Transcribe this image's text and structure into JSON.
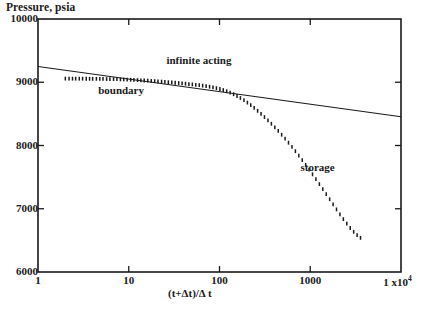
{
  "chart_data": {
    "type": "scatter",
    "title": "",
    "ylabel": "Pressure, psia",
    "xlabel": "(t+Δt)/Δ t",
    "xscale": "log",
    "yscale": "linear",
    "xlim": [
      1,
      10000
    ],
    "ylim": [
      6000,
      10000
    ],
    "grid": false,
    "legend": null,
    "xticks": [
      {
        "value": 1,
        "label": "1"
      },
      {
        "value": 10,
        "label": "10"
      },
      {
        "value": 100,
        "label": "100"
      },
      {
        "value": 1000,
        "label": "1000"
      },
      {
        "value": 10000,
        "label": "1 x10",
        "exponent": "4"
      }
    ],
    "yticks": [
      {
        "value": 6000,
        "label": "6000"
      },
      {
        "value": 7000,
        "label": "7000"
      },
      {
        "value": 8000,
        "label": "8000"
      },
      {
        "value": 9000,
        "label": "9000"
      },
      {
        "value": 10000,
        "label": "10000"
      }
    ],
    "annotations": [
      {
        "text": "boundary",
        "x": 4.6,
        "y": 8860
      },
      {
        "text": "infinite acting",
        "x": 26,
        "y": 9330
      },
      {
        "text": "storage",
        "x": 780,
        "y": 7640
      }
    ],
    "series": [
      {
        "name": "semilog straight line",
        "type": "line",
        "style": "solid",
        "color": "#1a1a1a",
        "points": [
          {
            "x": 1,
            "y": 9250
          },
          {
            "x": 10000,
            "y": 8455
          }
        ]
      },
      {
        "name": "pressure data",
        "type": "scatter",
        "marker": "tick",
        "color": "#1a1a1a",
        "points": [
          {
            "x": 2.0,
            "y": 9058
          },
          {
            "x": 2.2,
            "y": 9058
          },
          {
            "x": 2.4,
            "y": 9057
          },
          {
            "x": 2.6,
            "y": 9057
          },
          {
            "x": 2.85,
            "y": 9056
          },
          {
            "x": 3.1,
            "y": 9056
          },
          {
            "x": 3.4,
            "y": 9055
          },
          {
            "x": 3.7,
            "y": 9055
          },
          {
            "x": 4.0,
            "y": 9054
          },
          {
            "x": 4.4,
            "y": 9054
          },
          {
            "x": 4.8,
            "y": 9053
          },
          {
            "x": 5.2,
            "y": 9052
          },
          {
            "x": 5.7,
            "y": 9051
          },
          {
            "x": 6.2,
            "y": 9050
          },
          {
            "x": 6.8,
            "y": 9049
          },
          {
            "x": 7.4,
            "y": 9048
          },
          {
            "x": 8.1,
            "y": 9046
          },
          {
            "x": 8.8,
            "y": 9044
          },
          {
            "x": 9.6,
            "y": 9042
          },
          {
            "x": 10.5,
            "y": 9040
          },
          {
            "x": 11.4,
            "y": 9037
          },
          {
            "x": 12.5,
            "y": 9034
          },
          {
            "x": 13.6,
            "y": 9031
          },
          {
            "x": 14.8,
            "y": 9028
          },
          {
            "x": 16.2,
            "y": 9025
          },
          {
            "x": 17.7,
            "y": 9021
          },
          {
            "x": 19.3,
            "y": 9018
          },
          {
            "x": 21.0,
            "y": 9014
          },
          {
            "x": 23.0,
            "y": 9010
          },
          {
            "x": 25.0,
            "y": 9006
          },
          {
            "x": 27.3,
            "y": 9001
          },
          {
            "x": 29.8,
            "y": 8997
          },
          {
            "x": 32.5,
            "y": 8992
          },
          {
            "x": 35.5,
            "y": 8987
          },
          {
            "x": 38.7,
            "y": 8982
          },
          {
            "x": 42.2,
            "y": 8977
          },
          {
            "x": 46.0,
            "y": 8971
          },
          {
            "x": 50.2,
            "y": 8966
          },
          {
            "x": 54.8,
            "y": 8960
          },
          {
            "x": 59.8,
            "y": 8953
          },
          {
            "x": 65.2,
            "y": 8946
          },
          {
            "x": 71.2,
            "y": 8938
          },
          {
            "x": 77.7,
            "y": 8929
          },
          {
            "x": 84.8,
            "y": 8919
          },
          {
            "x": 92.5,
            "y": 8907
          },
          {
            "x": 101,
            "y": 8893
          },
          {
            "x": 110,
            "y": 8877
          },
          {
            "x": 120,
            "y": 8858
          },
          {
            "x": 131,
            "y": 8836
          },
          {
            "x": 143,
            "y": 8811
          },
          {
            "x": 156,
            "y": 8783
          },
          {
            "x": 170,
            "y": 8751
          },
          {
            "x": 186,
            "y": 8716
          },
          {
            "x": 203,
            "y": 8678
          },
          {
            "x": 221,
            "y": 8637
          },
          {
            "x": 241,
            "y": 8594
          },
          {
            "x": 263,
            "y": 8548
          },
          {
            "x": 287,
            "y": 8500
          },
          {
            "x": 313,
            "y": 8450
          },
          {
            "x": 342,
            "y": 8398
          },
          {
            "x": 373,
            "y": 8344
          },
          {
            "x": 407,
            "y": 8288
          },
          {
            "x": 444,
            "y": 8230
          },
          {
            "x": 484,
            "y": 8170
          },
          {
            "x": 528,
            "y": 8108
          },
          {
            "x": 576,
            "y": 8044
          },
          {
            "x": 629,
            "y": 7978
          },
          {
            "x": 686,
            "y": 7910
          },
          {
            "x": 748,
            "y": 7840
          },
          {
            "x": 816,
            "y": 7768
          },
          {
            "x": 890,
            "y": 7695
          },
          {
            "x": 971,
            "y": 7620
          },
          {
            "x": 1059,
            "y": 7544
          },
          {
            "x": 1155,
            "y": 7467
          },
          {
            "x": 1260,
            "y": 7389
          },
          {
            "x": 1375,
            "y": 7310
          },
          {
            "x": 1500,
            "y": 7230
          },
          {
            "x": 1636,
            "y": 7150
          },
          {
            "x": 1785,
            "y": 7070
          },
          {
            "x": 1947,
            "y": 6990
          },
          {
            "x": 2124,
            "y": 6912
          },
          {
            "x": 2317,
            "y": 6836
          },
          {
            "x": 2528,
            "y": 6764
          },
          {
            "x": 2758,
            "y": 6696
          },
          {
            "x": 3009,
            "y": 6635
          },
          {
            "x": 3282,
            "y": 6582
          },
          {
            "x": 3580,
            "y": 6540
          }
        ]
      }
    ]
  }
}
